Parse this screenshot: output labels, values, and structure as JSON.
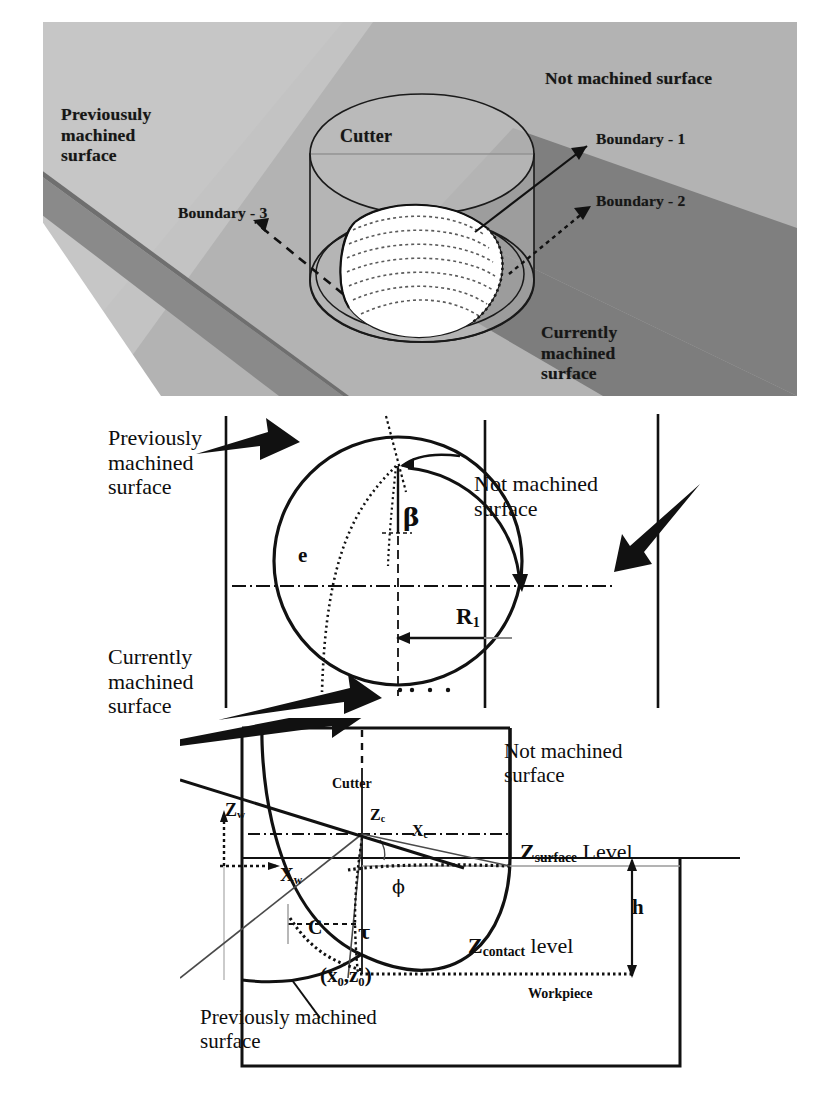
{
  "figure": {
    "colors": {
      "line": "#0d0d0d",
      "not_machined_fill": "#b4b4b4",
      "previously_machined_fill": "#c6c6c6",
      "currently_machined_fill": "#7e7e7e",
      "edge_band_fill": "#8a8a8a",
      "page_background": "#ffffff",
      "engagement_fill": "#ffffff"
    }
  },
  "iso_panel": {
    "name": "isometric-view",
    "labels": {
      "not_machined": "Not machined surface",
      "previously_machined": "Previousuly\nmachined\nsurface",
      "cutter": "Cutter",
      "boundary_1": "Boundary - 1",
      "boundary_2": "Boundary - 2",
      "boundary_3": "Boundary - 3",
      "currently_machined": "Currently\nmachined\nsurface"
    }
  },
  "top_panel": {
    "name": "plan-view",
    "labels": {
      "previously_machined": "Previously\nmachined\nsurface",
      "not_machined": "Not machined\nsurface",
      "currently_machined": "Currently\nmachined\nsurface",
      "beta": "β",
      "e": "e",
      "R1_base": "R",
      "R1_sub": "1"
    }
  },
  "side_panel": {
    "name": "section-view",
    "labels": {
      "not_machined": "Not machined\nsurface",
      "z_surface_base": "Z",
      "z_surface_sub": "surface",
      "z_surface_suffix": " Level",
      "z_contact_base": "Z",
      "z_contact_sub": "contact",
      "z_contact_suffix": " level",
      "workpiece": "Workpiece",
      "h": "h",
      "cutter": "Cutter",
      "z_w_base": "Z",
      "z_w_sub": "w",
      "x_w_base": "X",
      "x_w_sub": "w",
      "z_c_base": "Z",
      "z_c_sub": "c",
      "x_c_base": "X",
      "x_c_sub": "c",
      "phi": "ϕ",
      "tau": "τ",
      "C": "C",
      "origin": "(x₀,z₀)",
      "previously_machined": "Previously machined\nsurface"
    }
  }
}
